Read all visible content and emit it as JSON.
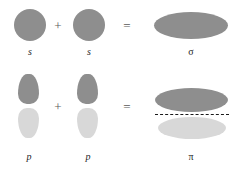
{
  "figure": {
    "background_color": "#ffffff",
    "width": 233,
    "height": 170
  },
  "colors": {
    "lobe_dark": "#8e8e8e",
    "lobe_light": "#d8d8d8",
    "operator": "#5a5a5a",
    "label": "#262626",
    "node_line": "#1a1a1a"
  },
  "rows": [
    {
      "id": "sigma-row",
      "name": "sigma-bond-formation",
      "operands": [
        {
          "id": "s-orbital-left",
          "label": "s",
          "italic": true,
          "shape": "circle"
        },
        {
          "id": "s-orbital-right",
          "label": "s",
          "italic": true,
          "shape": "circle"
        }
      ],
      "operators": [
        {
          "id": "plus",
          "glyph": "+"
        },
        {
          "id": "equals",
          "glyph": "="
        }
      ],
      "result": {
        "id": "sigma-orbital",
        "label": "σ",
        "italic": false,
        "shape": "ellipse"
      }
    },
    {
      "id": "pi-row",
      "name": "pi-bond-formation",
      "operands": [
        {
          "id": "p-orbital-left",
          "label": "p",
          "italic": true,
          "shape": "dumbbell"
        },
        {
          "id": "p-orbital-right",
          "label": "p",
          "italic": true,
          "shape": "dumbbell"
        }
      ],
      "operators": [
        {
          "id": "plus",
          "glyph": "+"
        },
        {
          "id": "equals",
          "glyph": "="
        }
      ],
      "result": {
        "id": "pi-orbital",
        "label": "π",
        "italic": false,
        "shape": "double-ellipse-with-node"
      }
    }
  ],
  "labels": {
    "s_left": "s",
    "s_right": "s",
    "sigma": "σ",
    "p_left": "p",
    "p_right": "p",
    "pi": "π",
    "plus_top": "+",
    "equals_top": "=",
    "plus_bottom": "+",
    "equals_bottom": "="
  }
}
